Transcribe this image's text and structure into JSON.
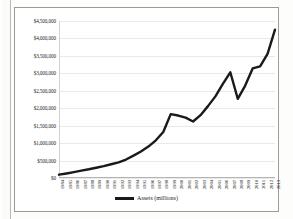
{
  "chart": {
    "legend_label": "Assets (millions)",
    "line_color": "#1a1a1a",
    "grid_color": "#e9e9e7",
    "text_color": "#1d1d1b",
    "background": "#ffffff"
  },
  "chart_data": {
    "type": "line",
    "title": "",
    "xlabel": "",
    "ylabel": "",
    "ylim": [
      0,
      4500000
    ],
    "ytick_labels": [
      "$4,500,000",
      "$4,000,000",
      "$3,500,000",
      "$3,000,000",
      "$2,500,000",
      "$2,000,000",
      "$1,500,000",
      "$1,000,000",
      "$500,000",
      "$0"
    ],
    "ytick_values": [
      4500000,
      4000000,
      3500000,
      3000000,
      2500000,
      2000000,
      1500000,
      1000000,
      500000,
      0
    ],
    "grid": true,
    "legend_position": "bottom",
    "categories": [
      "1984",
      "1985",
      "1986",
      "1987",
      "1988",
      "1989",
      "1990",
      "1991",
      "1992",
      "1993",
      "1994",
      "1995",
      "1996",
      "1997",
      "1998",
      "1999",
      "2000",
      "2001",
      "2002",
      "2003",
      "2004",
      "2005",
      "2006",
      "2007",
      "2008",
      "2009",
      "2010",
      "2011",
      "2012",
      "2013"
    ],
    "series": [
      {
        "name": "Assets (millions)",
        "values": [
          95000,
          130000,
          170000,
          210000,
          250000,
          295000,
          340000,
          395000,
          450000,
          530000,
          640000,
          760000,
          900000,
          1080000,
          1320000,
          1830000,
          1790000,
          1730000,
          1620000,
          1800000,
          2060000,
          2340000,
          2700000,
          3030000,
          2270000,
          2650000,
          3140000,
          3200000,
          3560000,
          4250000
        ]
      }
    ]
  }
}
